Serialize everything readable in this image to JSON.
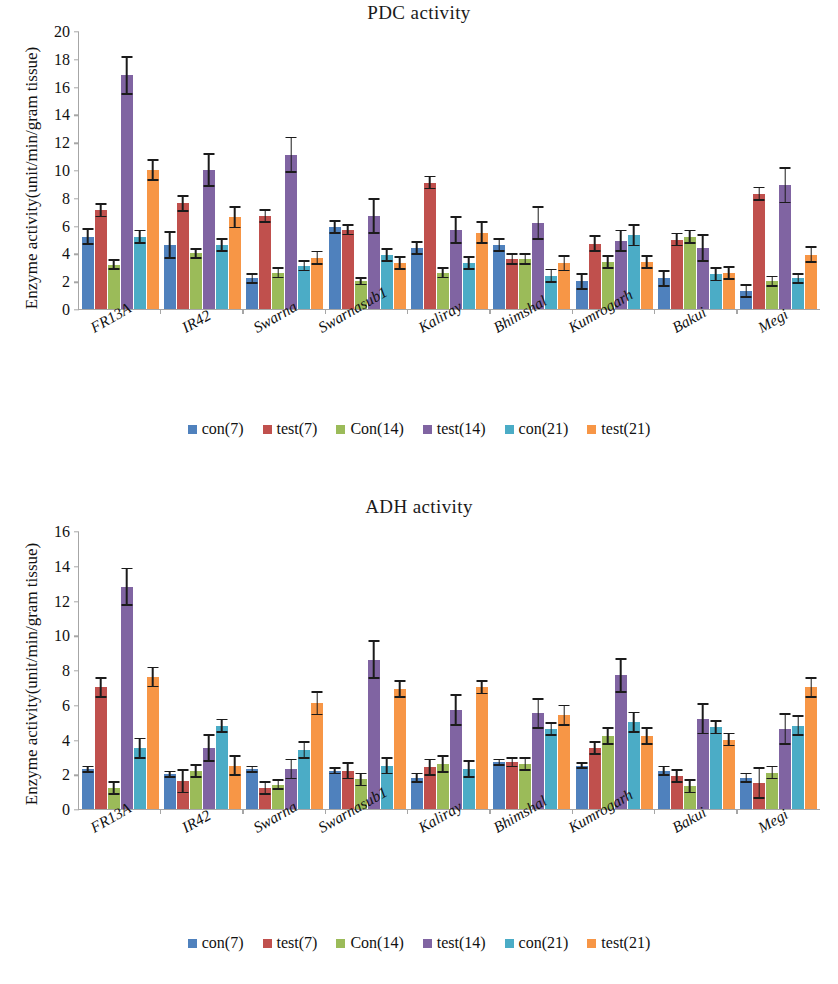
{
  "ylabel": "Enzyme activity(unit/min/gram tissue)",
  "series_colors": [
    "#4F81BD",
    "#C0504D",
    "#9BBB59",
    "#8064A2",
    "#4BACC6",
    "#F79646"
  ],
  "legend": [
    {
      "label": "con(7)",
      "color": "#4F81BD"
    },
    {
      "label": "test(7)",
      "color": "#C0504D"
    },
    {
      "label": "Con(14)",
      "color": "#9BBB59"
    },
    {
      "label": "test(14)",
      "color": "#8064A2"
    },
    {
      "label": "con(21)",
      "color": "#4BACC6"
    },
    {
      "label": "test(21)",
      "color": "#F79646"
    }
  ],
  "chart_data": [
    {
      "type": "bar",
      "title": "PDC activity",
      "xlabel": "",
      "ylabel": "Enzyme activity(unit/min/gram tissue)",
      "ylim": [
        0,
        20
      ],
      "yticks": [
        0,
        2,
        4,
        6,
        8,
        10,
        12,
        14,
        16,
        18,
        20
      ],
      "grid": false,
      "legend_position": "bottom",
      "categories": [
        "FR13A",
        "IR42",
        "Swarna",
        "Swarnasub1",
        "Kaliray",
        "Bhimshal",
        "Kumrogarh",
        "Bakui",
        "Megi"
      ],
      "series": [
        {
          "name": "con(7)",
          "color": "#4F81BD",
          "values": [
            5.2,
            4.6,
            2.2,
            5.9,
            4.4,
            4.6,
            2.0,
            2.2,
            1.3
          ],
          "errors": [
            0.6,
            1.0,
            0.4,
            0.5,
            0.5,
            0.5,
            0.6,
            0.6,
            0.5
          ]
        },
        {
          "name": "test(7)",
          "color": "#C0504D",
          "values": [
            7.1,
            7.6,
            6.7,
            5.7,
            9.1,
            3.6,
            4.7,
            5.0,
            8.3
          ],
          "errors": [
            0.5,
            0.6,
            0.5,
            0.4,
            0.5,
            0.4,
            0.6,
            0.5,
            0.5
          ]
        },
        {
          "name": "Con(14)",
          "color": "#9BBB59",
          "values": [
            3.2,
            4.0,
            2.6,
            2.0,
            2.6,
            3.6,
            3.4,
            5.2,
            2.0
          ],
          "errors": [
            0.4,
            0.4,
            0.4,
            0.3,
            0.4,
            0.4,
            0.5,
            0.5,
            0.4
          ]
        },
        {
          "name": "test(14)",
          "color": "#8064A2",
          "values": [
            16.8,
            10.0,
            11.1,
            6.7,
            5.7,
            6.2,
            4.9,
            4.4,
            8.9
          ],
          "errors": [
            1.4,
            1.2,
            1.3,
            1.3,
            1.0,
            1.2,
            0.8,
            1.0,
            1.3
          ]
        },
        {
          "name": "con(21)",
          "color": "#4BACC6",
          "values": [
            5.2,
            4.6,
            3.1,
            3.9,
            3.3,
            2.4,
            5.3,
            2.5,
            2.2
          ],
          "errors": [
            0.5,
            0.5,
            0.4,
            0.5,
            0.5,
            0.5,
            0.8,
            0.5,
            0.4
          ]
        },
        {
          "name": "test(21)",
          "color": "#F79646",
          "values": [
            10.0,
            6.6,
            3.7,
            3.3,
            5.5,
            3.3,
            3.4,
            2.6,
            3.9
          ],
          "errors": [
            0.8,
            0.8,
            0.5,
            0.5,
            0.8,
            0.6,
            0.5,
            0.5,
            0.6
          ]
        }
      ]
    },
    {
      "type": "bar",
      "title": "ADH activity",
      "xlabel": "",
      "ylabel": "Enzyme activity(unit/min/gram tissue)",
      "ylim": [
        0,
        16
      ],
      "yticks": [
        0,
        2,
        4,
        6,
        8,
        10,
        12,
        14,
        16
      ],
      "grid": false,
      "legend_position": "bottom",
      "categories": [
        "FR13A",
        "IR42",
        "Swarna",
        "Swarnasub1",
        "Kaliray",
        "Bhimshal",
        "Kumrogarh",
        "Bakui",
        "Megi"
      ],
      "series": [
        {
          "name": "con(7)",
          "color": "#4F81BD",
          "values": [
            2.3,
            2.0,
            2.3,
            2.2,
            1.8,
            2.7,
            2.5,
            2.2,
            1.8
          ],
          "errors": [
            0.2,
            0.2,
            0.2,
            0.2,
            0.3,
            0.2,
            0.2,
            0.3,
            0.3
          ]
        },
        {
          "name": "test(7)",
          "color": "#C0504D",
          "values": [
            7.0,
            1.6,
            1.2,
            2.2,
            2.4,
            2.7,
            3.5,
            1.9,
            1.5
          ],
          "errors": [
            0.6,
            0.7,
            0.4,
            0.5,
            0.5,
            0.3,
            0.4,
            0.4,
            0.9
          ]
        },
        {
          "name": "Con(14)",
          "color": "#9BBB59",
          "values": [
            1.2,
            2.2,
            1.4,
            1.7,
            2.6,
            2.6,
            4.2,
            1.3,
            2.1
          ],
          "errors": [
            0.4,
            0.4,
            0.3,
            0.4,
            0.5,
            0.4,
            0.5,
            0.4,
            0.4
          ]
        },
        {
          "name": "test(14)",
          "color": "#8064A2",
          "values": [
            12.8,
            3.5,
            2.3,
            8.6,
            5.7,
            5.5,
            7.7,
            5.2,
            4.6
          ],
          "errors": [
            1.1,
            0.8,
            0.6,
            1.1,
            0.9,
            0.9,
            1.0,
            0.9,
            0.9
          ]
        },
        {
          "name": "con(21)",
          "color": "#4BACC6",
          "values": [
            3.5,
            4.8,
            3.4,
            2.5,
            2.3,
            4.6,
            5.0,
            4.7,
            4.8
          ],
          "errors": [
            0.6,
            0.4,
            0.5,
            0.5,
            0.5,
            0.4,
            0.6,
            0.4,
            0.6
          ]
        },
        {
          "name": "test(21)",
          "color": "#F79646",
          "values": [
            7.6,
            2.5,
            6.1,
            6.9,
            7.0,
            5.4,
            4.2,
            4.0,
            7.0
          ],
          "errors": [
            0.6,
            0.6,
            0.7,
            0.5,
            0.4,
            0.6,
            0.5,
            0.4,
            0.6
          ]
        }
      ]
    }
  ]
}
